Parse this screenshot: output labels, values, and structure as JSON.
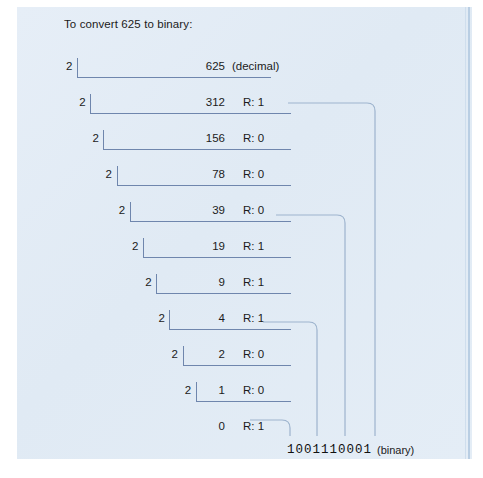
{
  "figure": {
    "title": "To convert 625 to binary:",
    "decimal_label": "(decimal)",
    "binary_label": "(binary)",
    "binary_result": "1001110001",
    "accent_color": "#6f86ad",
    "panel_color": "#e2ecf6",
    "text_color": "#1b1b1b"
  },
  "rows": [
    {
      "divisor": "2",
      "quotient": "625",
      "remainder": "",
      "note": "(decimal)",
      "has_bracket": true,
      "indent": 0
    },
    {
      "divisor": "2",
      "quotient": "312",
      "remainder": "R: 1",
      "note": "",
      "has_bracket": true,
      "indent": 1
    },
    {
      "divisor": "2",
      "quotient": "156",
      "remainder": "R: 0",
      "note": "",
      "has_bracket": true,
      "indent": 2
    },
    {
      "divisor": "2",
      "quotient": "78",
      "remainder": "R: 0",
      "note": "",
      "has_bracket": true,
      "indent": 3
    },
    {
      "divisor": "2",
      "quotient": "39",
      "remainder": "R: 0",
      "note": "",
      "has_bracket": true,
      "indent": 4
    },
    {
      "divisor": "2",
      "quotient": "19",
      "remainder": "R: 1",
      "note": "",
      "has_bracket": true,
      "indent": 5
    },
    {
      "divisor": "2",
      "quotient": "9",
      "remainder": "R: 1",
      "note": "",
      "has_bracket": true,
      "indent": 6
    },
    {
      "divisor": "2",
      "quotient": "4",
      "remainder": "R: 1",
      "note": "",
      "has_bracket": true,
      "indent": 7
    },
    {
      "divisor": "2",
      "quotient": "2",
      "remainder": "R: 0",
      "note": "",
      "has_bracket": true,
      "indent": 8
    },
    {
      "divisor": "2",
      "quotient": "1",
      "remainder": "R: 0",
      "note": "",
      "has_bracket": true,
      "indent": 9
    },
    {
      "divisor": "",
      "quotient": "0",
      "remainder": "R: 1",
      "note": "",
      "has_bracket": false,
      "indent": 10
    }
  ],
  "chart_data": {
    "type": "diagram",
    "title": "To convert 625 to binary:",
    "method": "repeated-division-by-2",
    "divisor": 2,
    "input_decimal": 625,
    "output_binary": "1001110001",
    "steps": [
      {
        "step": 1,
        "dividend": 625,
        "quotient": 312,
        "remainder": 1
      },
      {
        "step": 2,
        "dividend": 312,
        "quotient": 156,
        "remainder": 0
      },
      {
        "step": 3,
        "dividend": 156,
        "quotient": 78,
        "remainder": 0
      },
      {
        "step": 4,
        "dividend": 78,
        "quotient": 39,
        "remainder": 0
      },
      {
        "step": 5,
        "dividend": 39,
        "quotient": 19,
        "remainder": 1
      },
      {
        "step": 6,
        "dividend": 19,
        "quotient": 9,
        "remainder": 1
      },
      {
        "step": 7,
        "dividend": 9,
        "quotient": 4,
        "remainder": 1
      },
      {
        "step": 8,
        "dividend": 4,
        "quotient": 2,
        "remainder": 0
      },
      {
        "step": 9,
        "dividend": 2,
        "quotient": 1,
        "remainder": 0
      },
      {
        "step": 10,
        "dividend": 1,
        "quotient": 0,
        "remainder": 1
      }
    ],
    "connector_rows": [
      1,
      4,
      7,
      10
    ],
    "annotations": [
      "(decimal)",
      "(binary)"
    ]
  }
}
